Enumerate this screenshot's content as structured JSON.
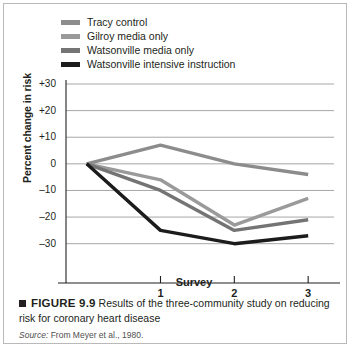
{
  "figure": {
    "bullet_icon": "black-square-bullet",
    "figure_number": "FIGURE 9.9",
    "caption_text": "Results of the three-community study on reducing risk for coronary heart disease",
    "source_word": "Source:",
    "source_text": "From Meyer et al., 1980."
  },
  "chart_data": {
    "type": "line",
    "title": "",
    "xlabel": "Survey",
    "ylabel": "Percent change in risk",
    "x": [
      0,
      1,
      2,
      3
    ],
    "categories": [
      "",
      "1",
      "2",
      "3"
    ],
    "xtick_labels": [
      "1",
      "2",
      "3"
    ],
    "ytick_labels": [
      "+30",
      "+20",
      "+10",
      "0",
      "–10",
      "–20",
      "–30"
    ],
    "ytick_values": [
      30,
      20,
      10,
      0,
      -10,
      -20,
      -30
    ],
    "ylim": [
      -35,
      30
    ],
    "xlim": [
      -0.28,
      3.35
    ],
    "grid": true,
    "legend_position": "top-left-above-axes",
    "series": [
      {
        "name": "Tracy control",
        "color": "#8c8c8c",
        "values": [
          0,
          7,
          0,
          -4
        ]
      },
      {
        "name": "Gilroy media only",
        "color": "#9a9a9a",
        "values": [
          0,
          -6,
          -23,
          -13
        ]
      },
      {
        "name": "Watsonville media only",
        "color": "#747474",
        "values": [
          0,
          -10,
          -25,
          -21
        ]
      },
      {
        "name": "Watsonville intensive instruction",
        "color": "#1c1c1c",
        "values": [
          0,
          -25,
          -30,
          -27
        ]
      }
    ]
  }
}
